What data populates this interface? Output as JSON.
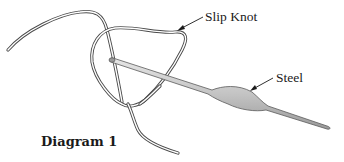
{
  "caption": "Diagram 1",
  "labels": {
    "slip_knot": "Slip Knot",
    "steel": "Steel"
  },
  "colors": {
    "thread_outline": "#4a4a4a",
    "thread_fill": "#ffffff",
    "needle_fill": "#c8c8c8",
    "needle_outline": "#5a5a5a",
    "text": "#1a1a1a"
  }
}
